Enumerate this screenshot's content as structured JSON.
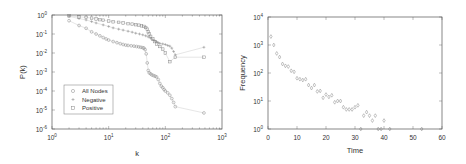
{
  "chart_data": [
    {
      "type": "scatter",
      "title": "",
      "xlabel": "k",
      "ylabel": "P(k)",
      "xscale": "log",
      "yscale": "log",
      "xlim": [
        1,
        1000
      ],
      "ylim": [
        1e-06,
        1
      ],
      "x_ticks": [
        "10^0",
        "10^1",
        "10^2",
        "10^3"
      ],
      "y_ticks": [
        "10^0",
        "10^-1",
        "10^-2",
        "10^-3",
        "10^-4",
        "10^-5",
        "10^-6"
      ],
      "grid": false,
      "legend_position": "lower left",
      "legend": [
        "All Nodes",
        "Negative",
        "Positive"
      ],
      "series": [
        {
          "name": "All Nodes",
          "marker": "circle",
          "x": [
            2,
            3,
            4,
            5,
            6,
            7,
            8,
            9,
            10,
            12,
            14,
            16,
            18,
            20,
            22,
            25,
            28,
            31,
            34,
            37,
            40,
            42,
            44,
            46,
            48,
            50,
            52,
            55,
            58,
            62,
            66,
            70,
            75,
            80,
            85,
            90,
            95,
            100,
            110,
            120,
            130,
            140,
            150,
            480
          ],
          "y": [
            0.5,
            0.28,
            0.2,
            0.13,
            0.1,
            0.08,
            0.065,
            0.055,
            0.048,
            0.04,
            0.035,
            0.031,
            0.028,
            0.026,
            0.025,
            0.024,
            0.023,
            0.022,
            0.021,
            0.02,
            0.019,
            0.018,
            0.015,
            0.009,
            0.003,
            0.0012,
            0.0009,
            0.0008,
            0.0007,
            0.00065,
            0.0006,
            0.00055,
            0.0004,
            0.00025,
            0.00018,
            0.00015,
            0.00012,
            0.0001,
            8e-05,
            6e-05,
            4e-05,
            2.5e-05,
            1.5e-05,
            7e-06
          ]
        },
        {
          "name": "Negative",
          "marker": "plus",
          "x": [
            2,
            3,
            4,
            5,
            6,
            8,
            10,
            12,
            15,
            18,
            22,
            26,
            30,
            35,
            40,
            45,
            50,
            55,
            60,
            65,
            70,
            75,
            80,
            90,
            100,
            110,
            120,
            130,
            140,
            150,
            480
          ],
          "y": [
            0.85,
            0.65,
            0.55,
            0.45,
            0.38,
            0.3,
            0.25,
            0.21,
            0.18,
            0.16,
            0.14,
            0.125,
            0.11,
            0.1,
            0.09,
            0.08,
            0.07,
            0.06,
            0.05,
            0.045,
            0.04,
            0.035,
            0.032,
            0.03,
            0.028,
            0.025,
            0.023,
            0.018,
            0.012,
            0.008,
            0.02
          ]
        },
        {
          "name": "Positive",
          "marker": "square",
          "x": [
            2,
            3,
            4,
            5,
            6,
            7,
            8,
            10,
            12,
            15,
            18,
            22,
            26,
            30,
            34,
            38,
            42,
            45,
            48,
            50,
            52,
            55,
            60,
            65,
            70,
            80,
            90,
            100,
            120,
            150,
            480
          ],
          "y": [
            0.9,
            0.8,
            0.75,
            0.68,
            0.62,
            0.57,
            0.53,
            0.48,
            0.44,
            0.41,
            0.38,
            0.35,
            0.33,
            0.31,
            0.29,
            0.27,
            0.25,
            0.22,
            0.18,
            0.13,
            0.1,
            0.075,
            0.055,
            0.04,
            0.03,
            0.022,
            0.016,
            0.01,
            0.0035,
            0.006,
            0.006
          ]
        }
      ]
    },
    {
      "type": "scatter",
      "title": "",
      "xlabel": "Time",
      "ylabel": "Frequency",
      "xscale": "linear",
      "yscale": "log",
      "xlim": [
        0,
        60
      ],
      "ylim": [
        1,
        10000
      ],
      "x_ticks": [
        "0",
        "10",
        "20",
        "30",
        "40",
        "50",
        "60"
      ],
      "y_ticks": [
        "10^0",
        "10^1",
        "10^2",
        "10^3",
        "10^4"
      ],
      "grid": false,
      "legend": [],
      "series": [
        {
          "name": "Frequency",
          "marker": "diamond",
          "x": [
            1,
            2,
            3,
            4,
            5,
            6,
            7,
            8,
            9,
            10,
            11,
            12,
            13,
            14,
            15,
            16,
            17,
            18,
            19,
            20,
            21,
            22,
            23,
            24,
            25,
            26,
            27,
            28,
            29,
            30,
            31,
            32,
            33,
            34,
            35,
            36,
            37,
            38,
            39,
            40,
            42,
            53
          ],
          "y": [
            2000,
            1000,
            500,
            370,
            210,
            180,
            170,
            120,
            110,
            65,
            60,
            56,
            60,
            37,
            29,
            37,
            22,
            23,
            13,
            17,
            14,
            16,
            9,
            10,
            10,
            6,
            5,
            5,
            5,
            6,
            7,
            1,
            3,
            4,
            3,
            2,
            3,
            1,
            1,
            2,
            1,
            1
          ]
        }
      ]
    }
  ],
  "left_chart": {
    "ylabel": "P(k)",
    "xlabel": "k",
    "x_ticks": [
      {
        "base": "10",
        "exp": "0"
      },
      {
        "base": "10",
        "exp": "1"
      },
      {
        "base": "10",
        "exp": "2"
      },
      {
        "base": "10",
        "exp": "3"
      }
    ],
    "y_ticks": [
      {
        "base": "10",
        "exp": "0"
      },
      {
        "base": "10",
        "exp": "-1"
      },
      {
        "base": "10",
        "exp": "-2"
      },
      {
        "base": "10",
        "exp": "-3"
      },
      {
        "base": "10",
        "exp": "-4"
      },
      {
        "base": "10",
        "exp": "-5"
      },
      {
        "base": "10",
        "exp": "-6"
      }
    ],
    "legend": [
      "All Nodes",
      "Negative",
      "Positive"
    ]
  },
  "right_chart": {
    "ylabel": "Frequency",
    "xlabel": "Time",
    "x_ticks": [
      "0",
      "10",
      "20",
      "30",
      "40",
      "50",
      "60"
    ],
    "y_ticks": [
      {
        "base": "10",
        "exp": "0"
      },
      {
        "base": "10",
        "exp": "1"
      },
      {
        "base": "10",
        "exp": "2"
      },
      {
        "base": "10",
        "exp": "3"
      },
      {
        "base": "10",
        "exp": "4"
      }
    ]
  },
  "colors": {
    "axis": "#555555",
    "marker": "#888888",
    "line": "#aaaaaa",
    "background": "#ffffff"
  }
}
